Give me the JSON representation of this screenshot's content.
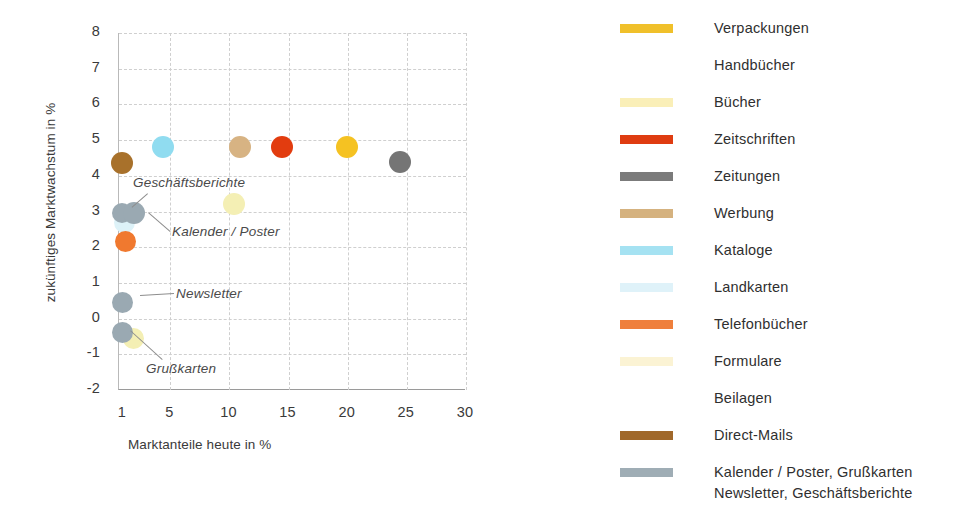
{
  "chart_data": {
    "type": "scatter",
    "title": "",
    "xlabel": "Marktanteile heute in %",
    "ylabel": "zukünftiges Marktwachstum in %",
    "xlim": [
      1,
      30
    ],
    "ylim": [
      -2,
      8
    ],
    "xticks": [
      "1",
      "5",
      "10",
      "15",
      "20",
      "25",
      "30"
    ],
    "xtick_values": [
      1,
      5,
      10,
      15,
      20,
      25,
      30
    ],
    "yticks": [
      "8",
      "7",
      "6",
      "5",
      "4",
      "3",
      "2",
      "1",
      "0",
      "-1",
      "-2"
    ],
    "ytick_values": [
      8,
      7,
      6,
      5,
      4,
      3,
      2,
      1,
      0,
      -1,
      -2
    ],
    "grid": true,
    "legend_position": "right",
    "points": [
      {
        "name": "Direct-Mails",
        "x": 1.0,
        "y": 4.35,
        "color": "#a8712b"
      },
      {
        "name": "Kataloge",
        "x": 4.5,
        "y": 4.8,
        "color": "#90dcf0"
      },
      {
        "name": "Werbung",
        "x": 11.0,
        "y": 4.8,
        "color": "#d7b383"
      },
      {
        "name": "Zeitschriften",
        "x": 14.5,
        "y": 4.8,
        "color": "#e23c0f"
      },
      {
        "name": "Verpackungen",
        "x": 20.0,
        "y": 4.8,
        "color": "#f5c222"
      },
      {
        "name": "Zeitungen",
        "x": 24.5,
        "y": 4.4,
        "color": "#757575"
      },
      {
        "name": "Bücher",
        "x": 10.5,
        "y": 3.2,
        "color": "#f4efb4"
      },
      {
        "name": "Geschäftsberichte",
        "x": 1.0,
        "y": 2.95,
        "color": "#9aa9b2"
      },
      {
        "name": "Kalender / Poster",
        "x": 2.0,
        "y": 2.95,
        "color": "#9aa9b2"
      },
      {
        "name": "Landkarten",
        "x": 1.2,
        "y": 2.68,
        "color": "#ddf2f8"
      },
      {
        "name": "Telefonbücher",
        "x": 1.3,
        "y": 2.15,
        "color": "#f0792f"
      },
      {
        "name": "Newsletter",
        "x": 1.0,
        "y": 0.45,
        "color": "#9aa9b2"
      },
      {
        "name": "Grußkarten",
        "x": 1.0,
        "y": -0.4,
        "color": "#9aa9b2"
      },
      {
        "name": "Formulare",
        "x": 2.0,
        "y": -0.55,
        "color": "#f4efb4"
      }
    ],
    "annotations": [
      {
        "text": "Geschäftsberichte"
      },
      {
        "text": "Kalender / Poster"
      },
      {
        "text": "Newsletter"
      },
      {
        "text": "Grußkarten"
      }
    ],
    "legend": [
      {
        "label": "Verpackungen",
        "color": "#f0c02a",
        "swatch": true
      },
      {
        "label": "Handbücher",
        "color": "#ffffff",
        "swatch": false
      },
      {
        "label": "Bücher",
        "color": "#faefb8",
        "swatch": true
      },
      {
        "label": "Zeitschriften",
        "color": "#df3c11",
        "swatch": true
      },
      {
        "label": "Zeitungen",
        "color": "#7b7b7b",
        "swatch": true
      },
      {
        "label": "Werbung",
        "color": "#d5b27f",
        "swatch": true
      },
      {
        "label": "Kataloge",
        "color": "#a5e2f2",
        "swatch": true
      },
      {
        "label": "Landkarten",
        "color": "#dff2f9",
        "swatch": true
      },
      {
        "label": "Telefonbücher",
        "color": "#ef7f3c",
        "swatch": true
      },
      {
        "label": "Formulare",
        "color": "#fbf3d4",
        "swatch": true
      },
      {
        "label": "Beilagen",
        "color": "#ffffff",
        "swatch": false
      },
      {
        "label": "Direct-Mails",
        "color": "#a0682a",
        "swatch": true
      },
      {
        "label": "Kalender / Poster, Grußkarten",
        "label2": "Newsletter, Geschäftsberichte",
        "color": "#9fadb5",
        "swatch": true
      }
    ]
  }
}
